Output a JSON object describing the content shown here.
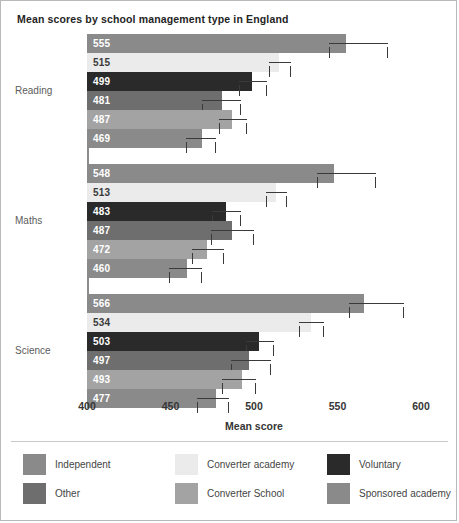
{
  "chart_data": {
    "type": "bar",
    "orientation": "horizontal",
    "title": "Mean scores by school management type in England",
    "xlabel": "Mean score",
    "ylabel": "",
    "xlim": [
      400,
      600
    ],
    "xticks": [
      400,
      450,
      500,
      550,
      600
    ],
    "grid": false,
    "legend_position": "bottom",
    "categories": [
      "Reading",
      "Maths",
      "Science"
    ],
    "series": [
      {
        "name": "Independent",
        "color": "#8a8a8a",
        "values": [
          555,
          548,
          566
        ],
        "errors": [
          {
            "low": 545,
            "high": 580
          },
          {
            "low": 538,
            "high": 573
          },
          {
            "low": 557,
            "high": 590
          }
        ]
      },
      {
        "name": "Converter academy",
        "color": "#ebebeb",
        "values": [
          515,
          513,
          534
        ],
        "errors": [
          {
            "low": 509,
            "high": 522
          },
          {
            "low": 507,
            "high": 520
          },
          {
            "low": 527,
            "high": 542
          }
        ]
      },
      {
        "name": "Voluntary",
        "color": "#2a2a2a",
        "values": [
          499,
          483,
          503
        ],
        "errors": [
          {
            "low": 491,
            "high": 508
          },
          {
            "low": 475,
            "high": 492
          },
          {
            "low": 495,
            "high": 512
          }
        ]
      },
      {
        "name": "Other",
        "color": "#6e6e6e",
        "values": [
          481,
          487,
          497
        ],
        "errors": [
          {
            "low": 469,
            "high": 492
          },
          {
            "low": 474,
            "high": 500
          },
          {
            "low": 486,
            "high": 510
          }
        ]
      },
      {
        "name": "Converter School",
        "color": "#a3a3a3",
        "values": [
          487,
          472,
          493
        ],
        "errors": [
          {
            "low": 479,
            "high": 496
          },
          {
            "low": 463,
            "high": 482
          },
          {
            "low": 481,
            "high": 501
          }
        ]
      },
      {
        "name": "Sponsored academy",
        "color": "#8a8a8a",
        "values": [
          469,
          460,
          477
        ],
        "errors": [
          {
            "low": 459,
            "high": 477
          },
          {
            "low": 449,
            "high": 469
          },
          {
            "low": 466,
            "high": 485
          }
        ]
      }
    ]
  },
  "legend": {
    "items": [
      {
        "label": "Independent",
        "color": "#8a8a8a"
      },
      {
        "label": "Converter academy",
        "color": "#ebebeb"
      },
      {
        "label": "Voluntary",
        "color": "#2a2a2a"
      },
      {
        "label": "Other",
        "color": "#6e6e6e"
      },
      {
        "label": "Converter School",
        "color": "#a3a3a3"
      },
      {
        "label": "Sponsored academy",
        "color": "#8a8a8a"
      }
    ]
  }
}
